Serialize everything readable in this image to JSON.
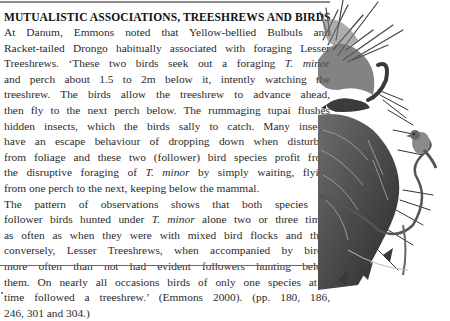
{
  "article": {
    "title": "MUTUALISTIC ASSOCIATIONS, TREESHREWS AND BIRDS",
    "paragraph1": {
      "lines": [
        "At Danum, Emmons noted that Yellow-bellied Bulbuls and",
        "Racket-tailed Drongo habitually associated with foraging Lesser",
        [
          "Treeshrews. ‘These two birds seek out a foraging ",
          "T. minor",
          ""
        ],
        "and perch about 1.5 to 2m below it, intently watching the",
        "treeshrew. The birds allow the treeshrew to advance ahead,",
        "then fly to the next perch below. The rummaging tupai flushes",
        "hidden insects, which the birds sally to catch. Many insects",
        "have an escape behaviour of dropping down when disturbed",
        "from foliage and these two (follower) bird species profit from",
        [
          "the disruptive foraging of ",
          "T. minor",
          " by simply waiting, flying"
        ],
        "from one perch to the next, keeping below the mammal."
      ]
    },
    "paragraph2": {
      "lines": [
        "The pattern of observations shows that both species of",
        [
          "follower birds hunted under ",
          "T. minor",
          " alone two or three times"
        ],
        "as often as when they were with mixed bird flocks and that,",
        "conversely, Lesser Treeshrews, when accompanied by birds,",
        "more often than not had evident followers hunting below",
        "them. On nearly all occasions birds of only one species at a",
        "time followed a treeshrew.’ (Emmons 2000). (pp. 180, 186,",
        "246, 301 and 304.)"
      ]
    }
  },
  "illustration": {
    "subject": "treeshrew-and-bird-on-palm-illustration",
    "style": "grayscale pen-and-wash"
  },
  "colors": {
    "text": "#2b2b2b",
    "rule": "#6a6a6a",
    "background": "#ffffff"
  }
}
